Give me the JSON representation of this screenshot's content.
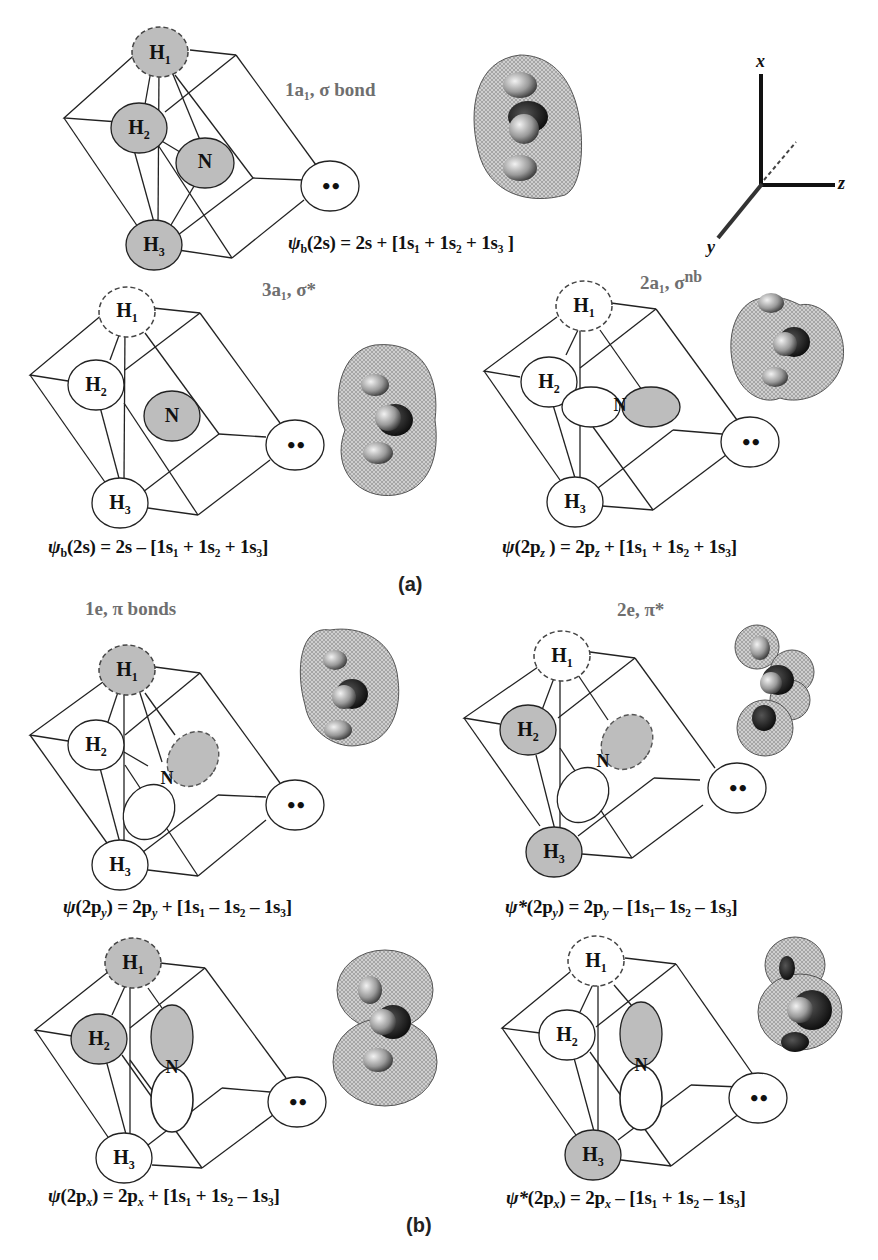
{
  "figure": {
    "subfigure_labels": {
      "a": "(a)",
      "b": "(b)"
    },
    "axes": {
      "x": "x",
      "y": "y",
      "z": "z"
    },
    "colors": {
      "shaded_orbital": "#bdbdbd",
      "unshaded_orbital": "#ffffff",
      "outline": "#222222",
      "title_gray": "#6f6f6f"
    },
    "panels": [
      {
        "id": "1a1",
        "title": "1a₁, σ bond",
        "equation": {
          "lhs_symbol": "ψ",
          "lhs_sub": "b",
          "lhs_arg": "(2s)",
          "rhs": "= 2s + [1s₁ + 1s₂ + 1s₃ ]"
        },
        "atoms": {
          "H1": "H",
          "H1_sub": "1",
          "H2": "H",
          "H2_sub": "2",
          "H3": "H",
          "H3_sub": "3",
          "N": "N",
          "lone_pair": "••"
        },
        "shading": {
          "H1": "shaded-dashed",
          "H2": "shaded",
          "H3": "shaded",
          "N": "shaded"
        }
      },
      {
        "id": "3a1",
        "title": "3a₁, σ*",
        "equation": {
          "lhs_symbol": "ψ",
          "lhs_sub": "b",
          "lhs_arg": "(2s)",
          "rhs": "= 2s – [1s₁ + 1s₂ + 1s₃]"
        },
        "atoms": {
          "H1": "H",
          "H1_sub": "1",
          "H2": "H",
          "H2_sub": "2",
          "H3": "H",
          "H3_sub": "3",
          "N": "N",
          "lone_pair": "••"
        },
        "shading": {
          "H1": "unshaded-dashed",
          "H2": "unshaded",
          "H3": "unshaded",
          "N": "shaded"
        }
      },
      {
        "id": "2a1",
        "title_main": "2a₁, σ",
        "title_sup": "nb",
        "equation": {
          "lhs_symbol": "ψ",
          "lhs_arg": "(2p",
          "lhs_arg_sub": "z",
          "lhs_close": " )",
          "rhs": "= 2p",
          "rhs_sub": "z",
          "rhs_tail": " + [1s₁ + 1s₂ + 1s₃]"
        },
        "atoms": {
          "H1": "H",
          "H1_sub": "1",
          "H2": "H",
          "H2_sub": "2",
          "H3": "H",
          "H3_sub": "3",
          "N": "N",
          "lone_pair": "••"
        },
        "shading": {
          "H1": "unshaded-dashed",
          "H2": "unshaded",
          "H3": "unshaded",
          "N_left": "unshaded",
          "N_right": "shaded"
        }
      },
      {
        "id": "1e-py",
        "title": "1e, π bonds",
        "equation": {
          "lhs_symbol": "ψ",
          "lhs_arg": "(2p",
          "lhs_arg_sub": "y",
          "lhs_close": ")",
          "rhs": "= 2p",
          "rhs_sub": "y",
          "rhs_tail": " + [1s₁ – 1s₂ – 1s₃]"
        },
        "atoms": {
          "H1": "H",
          "H1_sub": "1",
          "H2": "H",
          "H2_sub": "2",
          "H3": "H",
          "H3_sub": "3",
          "N": "N",
          "lone_pair": "••"
        },
        "shading": {
          "H1": "shaded-dashed",
          "H2": "unshaded",
          "H3": "unshaded",
          "N_upper": "shaded-dashed",
          "N_lower": "unshaded"
        }
      },
      {
        "id": "2e-py",
        "title": "2e, π*",
        "equation": {
          "lhs_symbol": "ψ*",
          "lhs_arg": "(2p",
          "lhs_arg_sub": "y",
          "lhs_close": ")",
          "rhs": "= 2p",
          "rhs_sub": "y",
          "rhs_tail": " – [1s₁– 1s₂ – 1s₃]"
        },
        "atoms": {
          "H1": "H",
          "H1_sub": "1",
          "H2": "H",
          "H2_sub": "2",
          "H3": "H",
          "H3_sub": "3",
          "N": "N",
          "lone_pair": "••"
        },
        "shading": {
          "H1": "unshaded-dashed",
          "H2": "shaded",
          "H3": "shaded",
          "N_upper": "shaded-dashed",
          "N_lower": "unshaded"
        }
      },
      {
        "id": "1e-px",
        "equation": {
          "lhs_symbol": "ψ",
          "lhs_arg": "(2p",
          "lhs_arg_sub": "x",
          "lhs_close": ")",
          "rhs": "= 2p",
          "rhs_sub": "x",
          "rhs_tail": " + [1s₁ + 1s₂ – 1s₃]"
        },
        "atoms": {
          "H1": "H",
          "H1_sub": "1",
          "H2": "H",
          "H2_sub": "2",
          "H3": "H",
          "H3_sub": "3",
          "N": "N",
          "lone_pair": "••"
        },
        "shading": {
          "H1": "shaded-dashed",
          "H2": "shaded",
          "H3": "unshaded",
          "N_upper": "shaded",
          "N_lower": "unshaded"
        }
      },
      {
        "id": "2e-px",
        "equation": {
          "lhs_symbol": "ψ*",
          "lhs_arg": "(2p",
          "lhs_arg_sub": "x",
          "lhs_close": ")",
          "rhs": "= 2p",
          "rhs_sub": "x",
          "rhs_tail": " – [1s₁ + 1s₂ – 1s₃]"
        },
        "atoms": {
          "H1": "H",
          "H1_sub": "1",
          "H2": "H",
          "H2_sub": "2",
          "H3": "H",
          "H3_sub": "3",
          "N": "N",
          "lone_pair": "••"
        },
        "shading": {
          "H1": "unshaded-dashed",
          "H2": "unshaded",
          "H3": "shaded",
          "N_upper": "shaded",
          "N_lower": "unshaded"
        }
      }
    ]
  }
}
